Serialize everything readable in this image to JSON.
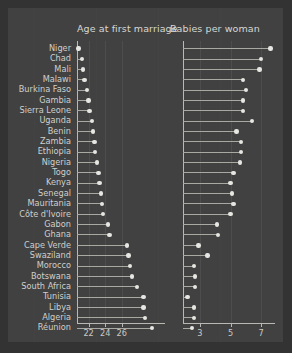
{
  "chart_data": {
    "type": "scatter",
    "title": "",
    "subtitle": "",
    "panels": [
      {
        "name": "age-at-first-marriage",
        "title": "Age at first marriage",
        "xlabel": "",
        "ylabel": "",
        "xlim": [
          20.6,
          31.2
        ],
        "ticks": [
          22,
          24,
          26
        ],
        "ticklabels": [
          "22",
          "24",
          "26"
        ],
        "grid": true
      },
      {
        "name": "babies-per-woman",
        "title": "Babies per woman",
        "xlabel": "",
        "ylabel": "",
        "xlim": [
          1.9,
          7.9
        ],
        "ticks": [
          3,
          5,
          7
        ],
        "ticklabels": [
          "3",
          "5",
          "7"
        ],
        "grid": true
      }
    ],
    "categories": [
      "Niger",
      "Chad",
      "Mali",
      "Malawi",
      "Burkina Faso",
      "Gambia",
      "Sierra Leone",
      "Uganda",
      "Benin",
      "Zambia",
      "Ethiopia",
      "Nigeria",
      "Togo",
      "Kenya",
      "Senegal",
      "Mauritania",
      "Côte d'Ivoire",
      "Gabon",
      "Ghana",
      "Cape Verde",
      "Swaziland",
      "Morocco",
      "Botswana",
      "South Africa",
      "Tunisia",
      "Libya",
      "Algeria",
      "Réunion"
    ],
    "series": [
      {
        "name": "Age at first marriage",
        "panel": "age-at-first-marriage",
        "values": [
          20.8,
          21.2,
          21.3,
          21.5,
          21.8,
          22.0,
          22.1,
          22.4,
          22.5,
          22.7,
          22.8,
          23.0,
          23.2,
          23.3,
          23.5,
          23.6,
          23.7,
          24.3,
          24.5,
          26.6,
          26.8,
          27.0,
          27.2,
          27.8,
          28.6,
          28.6,
          28.8,
          29.6
        ]
      },
      {
        "name": "Babies per woman",
        "panel": "babies-per-woman",
        "values": [
          7.6,
          7.0,
          6.9,
          5.8,
          6.0,
          5.8,
          5.8,
          6.4,
          5.4,
          5.7,
          5.7,
          5.6,
          5.2,
          5.0,
          5.1,
          5.2,
          5.0,
          4.1,
          4.2,
          2.9,
          3.5,
          2.6,
          2.7,
          2.7,
          2.2,
          2.6,
          2.6,
          2.5
        ]
      }
    ]
  }
}
